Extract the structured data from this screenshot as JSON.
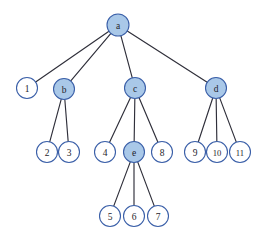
{
  "figure": {
    "type": "tree",
    "background_color": "#ffffff",
    "edge_color": "#2f2f3a",
    "node_fill_internal": "#a9c8e8",
    "node_fill_leaf": "#ffffff",
    "node_stroke": "#3a5fa8"
  },
  "caption": {
    "text": "",
    "visible": false
  },
  "chart_data": {
    "type": "diagram",
    "title": "",
    "nodes": [
      {
        "id": "a",
        "label": "a",
        "x": 118,
        "y": 25,
        "r": 11,
        "style": "filled",
        "level": 0
      },
      {
        "id": "1",
        "label": "1",
        "x": 27,
        "y": 88,
        "r": 10.5,
        "style": "open",
        "level": 1
      },
      {
        "id": "b",
        "label": "b",
        "x": 64,
        "y": 89,
        "r": 10.5,
        "style": "filled",
        "level": 1
      },
      {
        "id": "c",
        "label": "c",
        "x": 135,
        "y": 88,
        "r": 10.5,
        "style": "filled",
        "level": 1
      },
      {
        "id": "d",
        "label": "d",
        "x": 216,
        "y": 88,
        "r": 10.5,
        "style": "filled",
        "level": 1
      },
      {
        "id": "2",
        "label": "2",
        "x": 47,
        "y": 152,
        "r": 10.5,
        "style": "open",
        "level": 2
      },
      {
        "id": "3",
        "label": "3",
        "x": 69,
        "y": 152,
        "r": 10.5,
        "style": "open",
        "level": 2
      },
      {
        "id": "4",
        "label": "4",
        "x": 105,
        "y": 152,
        "r": 10.5,
        "style": "open",
        "level": 2
      },
      {
        "id": "e",
        "label": "e",
        "x": 134,
        "y": 152,
        "r": 10.5,
        "style": "filled",
        "level": 2
      },
      {
        "id": "8",
        "label": "8",
        "x": 162,
        "y": 152,
        "r": 10.5,
        "style": "open",
        "level": 2
      },
      {
        "id": "9",
        "label": "9",
        "x": 195,
        "y": 152,
        "r": 10.5,
        "style": "open",
        "level": 2
      },
      {
        "id": "10",
        "label": "10",
        "x": 217,
        "y": 152,
        "r": 10.5,
        "style": "open",
        "level": 2,
        "wide": true
      },
      {
        "id": "11",
        "label": "11",
        "x": 240,
        "y": 152,
        "r": 10.5,
        "style": "open",
        "level": 2,
        "wide": true
      },
      {
        "id": "5",
        "label": "5",
        "x": 110,
        "y": 216,
        "r": 10.5,
        "style": "open",
        "level": 3
      },
      {
        "id": "6",
        "label": "6",
        "x": 134,
        "y": 216,
        "r": 10.5,
        "style": "open",
        "level": 3
      },
      {
        "id": "7",
        "label": "7",
        "x": 158,
        "y": 216,
        "r": 10.5,
        "style": "open",
        "level": 3
      }
    ],
    "edges": [
      {
        "from": "a",
        "to": "1"
      },
      {
        "from": "a",
        "to": "b"
      },
      {
        "from": "a",
        "to": "c"
      },
      {
        "from": "a",
        "to": "d"
      },
      {
        "from": "b",
        "to": "2"
      },
      {
        "from": "b",
        "to": "3"
      },
      {
        "from": "c",
        "to": "4"
      },
      {
        "from": "c",
        "to": "e"
      },
      {
        "from": "c",
        "to": "8"
      },
      {
        "from": "d",
        "to": "9"
      },
      {
        "from": "d",
        "to": "10"
      },
      {
        "from": "d",
        "to": "11"
      },
      {
        "from": "e",
        "to": "5"
      },
      {
        "from": "e",
        "to": "6"
      },
      {
        "from": "e",
        "to": "7"
      }
    ]
  }
}
